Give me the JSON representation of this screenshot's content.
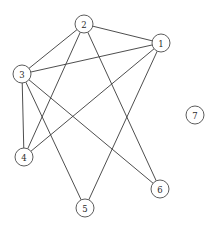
{
  "figure": {
    "background_color": "#ffffff",
    "width": 216,
    "height": 229
  },
  "chart_data": {
    "type": "diagram",
    "diagram_kind": "undirected-graph",
    "title": "",
    "node_radius": 9,
    "node_fill": "#ffffff",
    "node_stroke": "#4a4a4a",
    "edge_stroke": "#3a3a3a",
    "nodes": [
      {
        "id": "1",
        "label": "1",
        "x": 161,
        "y": 43
      },
      {
        "id": "2",
        "label": "2",
        "x": 84,
        "y": 24
      },
      {
        "id": "3",
        "label": "3",
        "x": 22,
        "y": 74
      },
      {
        "id": "4",
        "label": "4",
        "x": 24,
        "y": 157
      },
      {
        "id": "5",
        "label": "5",
        "x": 85,
        "y": 208
      },
      {
        "id": "6",
        "label": "6",
        "x": 160,
        "y": 189
      },
      {
        "id": "7",
        "label": "7",
        "x": 195,
        "y": 115
      }
    ],
    "edges": [
      {
        "source": "1",
        "target": "2"
      },
      {
        "source": "1",
        "target": "3"
      },
      {
        "source": "1",
        "target": "4"
      },
      {
        "source": "1",
        "target": "5"
      },
      {
        "source": "2",
        "target": "3"
      },
      {
        "source": "2",
        "target": "4"
      },
      {
        "source": "2",
        "target": "6"
      },
      {
        "source": "3",
        "target": "4"
      },
      {
        "source": "3",
        "target": "5"
      },
      {
        "source": "3",
        "target": "6"
      }
    ],
    "isolated_nodes": [
      "7"
    ],
    "node_count": 7,
    "edge_count": 10
  }
}
